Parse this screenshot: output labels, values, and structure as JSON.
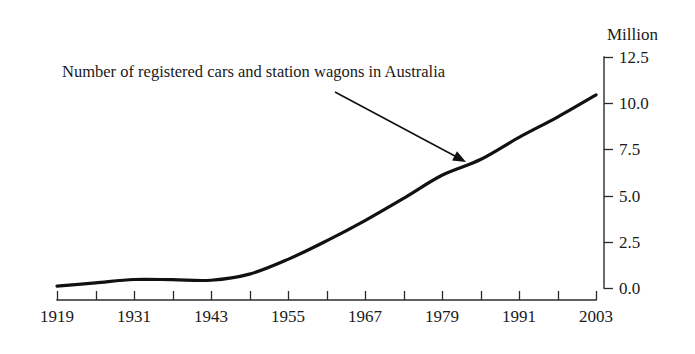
{
  "chart_data": {
    "type": "line",
    "title": "",
    "annotation": "Number of registered cars and station wagons in Australia",
    "xlabel": "",
    "ylabel": "Million",
    "unit_label": "Million",
    "xlim": [
      1919,
      2003
    ],
    "ylim": [
      0.0,
      12.5
    ],
    "grid": false,
    "legend": false,
    "x_tick_labels": [
      "1919",
      "1931",
      "1943",
      "1955",
      "1967",
      "1979",
      "1991",
      "2003"
    ],
    "x_tick_values": [
      1919,
      1931,
      1943,
      1955,
      1967,
      1979,
      1991,
      2003
    ],
    "x_minor_tick_values": [
      1919,
      1925,
      1931,
      1937,
      1943,
      1949,
      1955,
      1961,
      1967,
      1973,
      1979,
      1985,
      1991,
      1997,
      2003
    ],
    "y_tick_labels": [
      "0.0",
      "2.5",
      "5.0",
      "7.5",
      "10.0",
      "12.5"
    ],
    "y_tick_values": [
      0.0,
      2.5,
      5.0,
      7.5,
      10.0,
      12.5
    ],
    "y_axis_position": "right",
    "series": [
      {
        "name": "Registered cars and station wagons",
        "x": [
          1919,
          1925,
          1931,
          1937,
          1943,
          1949,
          1955,
          1961,
          1967,
          1973,
          1979,
          1985,
          1991,
          1997,
          2003
        ],
        "values": [
          0.1,
          0.28,
          0.46,
          0.45,
          0.42,
          0.75,
          1.55,
          2.55,
          3.65,
          4.85,
          6.1,
          6.95,
          8.15,
          9.25,
          10.45
        ]
      }
    ]
  },
  "annotation": {
    "text": "Number of registered cars and station wagons in Australia",
    "arrow_from": {
      "x": 335,
      "y": 92
    },
    "arrow_to": {
      "x": 466,
      "y": 162
    }
  },
  "colors": {
    "line": "#111111",
    "axis": "#2b2b2b",
    "text": "#1a1a1a",
    "background": "#ffffff"
  }
}
